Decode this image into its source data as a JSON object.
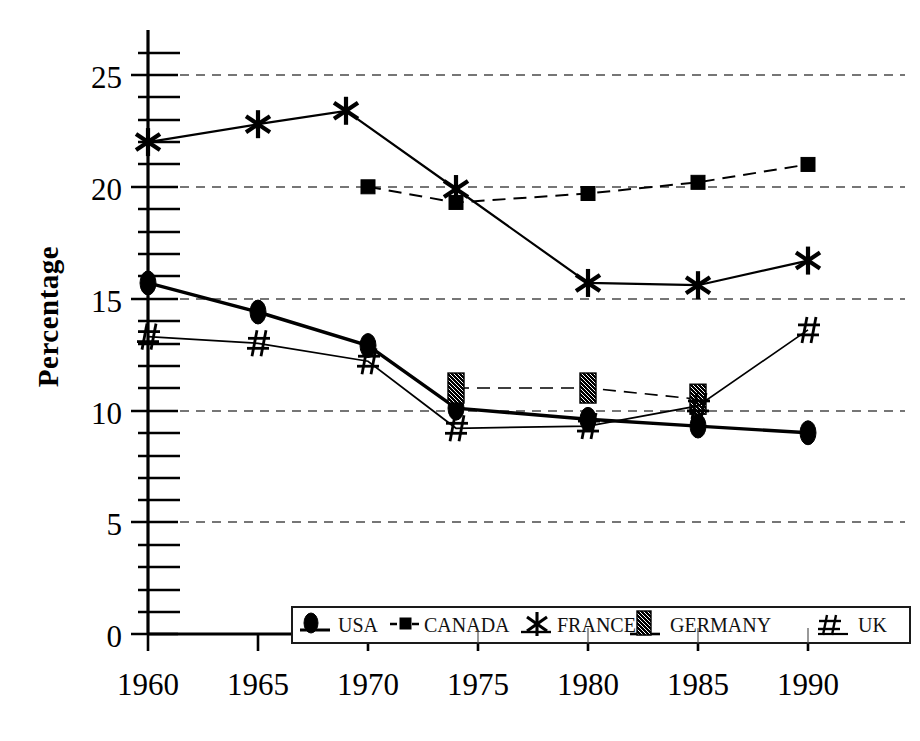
{
  "chart_data": {
    "type": "line",
    "title": "",
    "xlabel": "",
    "ylabel": "Percentage",
    "x": [
      1960,
      1965,
      1970,
      1974,
      1980,
      1985,
      1990
    ],
    "xtick_labels": [
      "1960",
      "1965",
      "1970",
      "1975",
      "1980",
      "1985",
      "1990"
    ],
    "xtick_values": [
      1960,
      1965,
      1970,
      1975,
      1980,
      1985,
      1990
    ],
    "ytick_labels": [
      "0",
      "5",
      "10",
      "15",
      "20",
      "25"
    ],
    "ytick_values": [
      0,
      5,
      10,
      15,
      20,
      25
    ],
    "xlim": [
      1958.1,
      1991.6
    ],
    "ylim": [
      0,
      26.2
    ],
    "grid": "horizontal-dashed",
    "minor_ticks_y": 1,
    "legend_position": "bottom-inside",
    "series": [
      {
        "name": "USA",
        "marker": "filled-ellipse",
        "line": "solid-thick",
        "x": [
          1960,
          1965,
          1970,
          1974,
          1980,
          1985,
          1990
        ],
        "values": [
          15.7,
          14.4,
          12.9,
          10.1,
          9.6,
          9.3,
          9.0
        ]
      },
      {
        "name": "CANADA",
        "marker": "small-square",
        "line": "dashed",
        "x": [
          1970,
          1974,
          1980,
          1985,
          1990
        ],
        "values": [
          20.0,
          19.3,
          19.7,
          20.2,
          21.0
        ]
      },
      {
        "name": "FRANCE",
        "marker": "asterisk",
        "line": "solid",
        "x": [
          1960,
          1965,
          1969,
          1974,
          1980,
          1985,
          1990
        ],
        "values": [
          22.0,
          22.8,
          23.4,
          19.9,
          15.7,
          15.6,
          16.7
        ]
      },
      {
        "name": "GERMANY",
        "marker": "hatched-rect",
        "line": "dashed",
        "x": [
          1974,
          1980,
          1985
        ],
        "values": [
          11.0,
          11.0,
          10.5
        ]
      },
      {
        "name": "UK",
        "marker": "hash",
        "line": "solid-thin",
        "x": [
          1960,
          1965,
          1970,
          1974,
          1980,
          1985,
          1990
        ],
        "values": [
          13.3,
          13.0,
          12.2,
          9.2,
          9.3,
          10.2,
          13.6
        ]
      }
    ]
  },
  "axes": {
    "y_title": "Percentage",
    "y_ticks": [
      "25",
      "20",
      "15",
      "10",
      "5",
      "0"
    ],
    "x_ticks": [
      "1960",
      "1965",
      "1970",
      "1975",
      "1980",
      "1985",
      "1990"
    ]
  },
  "legend": {
    "entries": [
      {
        "label": "USA",
        "icon": "filled-ellipse-marker-icon"
      },
      {
        "label": "CANADA",
        "icon": "small-square-marker-icon"
      },
      {
        "label": "FRANCE",
        "icon": "asterisk-marker-icon"
      },
      {
        "label": "GERMANY",
        "icon": "hatched-rect-marker-icon"
      },
      {
        "label": "UK",
        "icon": "hash-marker-icon"
      }
    ]
  },
  "colors": {
    "ink": "#000000",
    "grid": "#4a4a4a",
    "background": "#ffffff"
  }
}
